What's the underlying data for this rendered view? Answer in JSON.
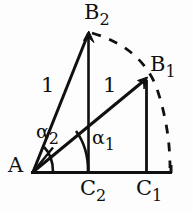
{
  "figure": {
    "kind": "geometry-diagram",
    "stroke_color": "#101010",
    "background_color": "#fdfdfd",
    "points": {
      "A": {
        "label_base": "A",
        "label_sub": "",
        "x": 33,
        "y": 172
      },
      "B1": {
        "label_base": "B",
        "label_sub": "1",
        "x": 147,
        "y": 78
      },
      "B2": {
        "label_base": "B",
        "label_sub": "2",
        "x": 89,
        "y": 31
      },
      "C1": {
        "label_base": "C",
        "label_sub": "1",
        "x": 147,
        "y": 172
      },
      "C2": {
        "label_base": "C",
        "label_sub": "2",
        "x": 89,
        "y": 172
      }
    },
    "segment_labels": [
      {
        "name": "length-ab2",
        "base": "1",
        "sub": ""
      },
      {
        "name": "length-ab1",
        "base": "1",
        "sub": ""
      }
    ],
    "angle_labels": [
      {
        "name": "alpha1",
        "base": "α",
        "sub": "1"
      },
      {
        "name": "alpha2",
        "base": "α",
        "sub": "2"
      }
    ]
  }
}
